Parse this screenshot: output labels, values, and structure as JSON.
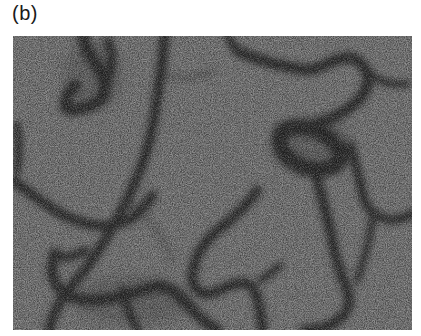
{
  "figure": {
    "panel_label": "(b)",
    "image": {
      "description": "grayscale micrograph showing a network of dark curvilinear veins on a noisy mid-gray background",
      "background_color": "#7a7a7a",
      "vein_color": "#262626"
    }
  }
}
